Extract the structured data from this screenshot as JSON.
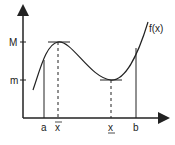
{
  "diagram": {
    "type": "function-extrema-on-interval",
    "curve_label": "f(x)",
    "y_labels": {
      "max": "M",
      "min": "m"
    },
    "x_labels": {
      "a": "a",
      "x_max": "x",
      "x_min": "x",
      "b": "b"
    },
    "x_max_decoration": "overline",
    "x_min_decoration": "underline",
    "colors": {
      "stroke": "#222222",
      "background": "#ffffff"
    }
  }
}
